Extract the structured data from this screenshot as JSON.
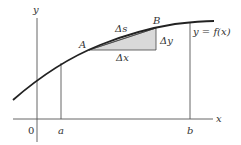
{
  "figure": {
    "axes": {
      "x_label": "x",
      "y_label": "y",
      "origin_label": "0"
    },
    "curve": {
      "label": "y = f(x)"
    },
    "bounds": {
      "a_label": "a",
      "b_label": "b"
    },
    "points": {
      "A": "A",
      "B": "B"
    },
    "increments": {
      "dx": "Δx",
      "dy": "Δy",
      "ds": "Δs"
    },
    "colors": {
      "stroke": "#222222",
      "thin_stroke": "#555555",
      "triangle_fill": "#d9d9d9",
      "text": "#333333"
    }
  }
}
